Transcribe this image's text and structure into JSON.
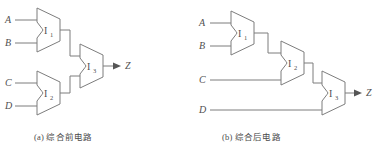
{
  "figure": {
    "title_a": "(a) 综合前电路",
    "title_b": "(b) 综合后电路",
    "line_color": "#7d7d7d",
    "text_color": "#4f4f4f",
    "background": "#ffffff"
  },
  "diagram_a": {
    "caption": "(a) 综合前电路",
    "inputs": [
      {
        "label": "A"
      },
      {
        "label": "B"
      },
      {
        "label": "C"
      },
      {
        "label": "D"
      }
    ],
    "output": {
      "label": "Z"
    },
    "muxes": [
      {
        "name": "I",
        "subscript": "1"
      },
      {
        "name": "I",
        "subscript": "2"
      },
      {
        "name": "I",
        "subscript": "3"
      }
    ]
  },
  "diagram_b": {
    "caption": "(b) 综合后电路",
    "inputs": [
      {
        "label": "A"
      },
      {
        "label": "B"
      },
      {
        "label": "C"
      },
      {
        "label": "D"
      }
    ],
    "output": {
      "label": "Z"
    },
    "muxes": [
      {
        "name": "I",
        "subscript": "1"
      },
      {
        "name": "I",
        "subscript": "2"
      },
      {
        "name": "I",
        "subscript": "3"
      }
    ]
  }
}
